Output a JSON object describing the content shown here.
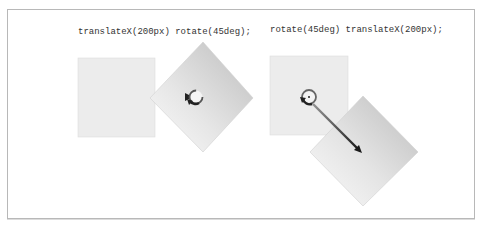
{
  "figure": {
    "panels": [
      {
        "id": "left",
        "caption": "translateX(200px) rotate(45deg);",
        "operations": [
          "translateX(200px)",
          "rotate(45deg)"
        ]
      },
      {
        "id": "right",
        "caption": "rotate(45deg) translateX(200px);",
        "operations": [
          "rotate(45deg)",
          "translateX(200px)"
        ]
      }
    ],
    "colors": {
      "frame": "#b8b8b8",
      "original_square": "#ececec",
      "transformed_square_dark": "#c4c4c4",
      "transformed_square_light": "#fafafa",
      "arrow": "#222222",
      "text": "#333333"
    }
  }
}
